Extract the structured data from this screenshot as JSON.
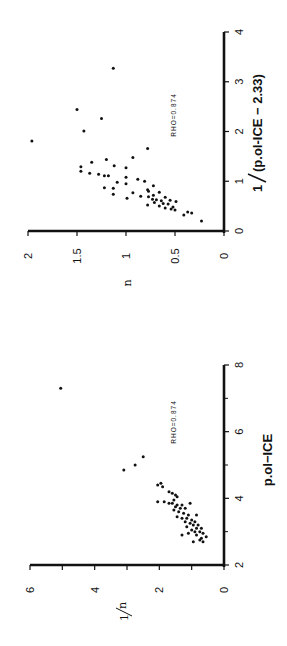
{
  "chart_data": [
    {
      "type": "scatter",
      "title": "",
      "orientation": "rotated 90 degrees counter-clockwise",
      "xlabel": "1/(p.ol-ICE - 2.33)",
      "ylabel": "n",
      "annotation": "RHO=0.874",
      "xlim": [
        0,
        4
      ],
      "ylim": [
        0,
        2
      ],
      "xticks": [
        "0",
        "1",
        "2",
        "3",
        "4"
      ],
      "yticks": [
        "0",
        "0.5",
        "1",
        "1.5",
        "2"
      ],
      "grid": false,
      "points": [
        [
          1.81,
          1.96
        ],
        [
          3.27,
          1.13
        ],
        [
          2.44,
          1.5
        ],
        [
          2.26,
          1.25
        ],
        [
          2.01,
          1.43
        ],
        [
          1.66,
          0.78
        ],
        [
          1.48,
          0.93
        ],
        [
          1.44,
          1.2
        ],
        [
          1.38,
          1.35
        ],
        [
          1.31,
          1.12
        ],
        [
          1.29,
          1.46
        ],
        [
          1.27,
          1.0
        ],
        [
          1.2,
          1.46
        ],
        [
          1.16,
          1.37
        ],
        [
          1.14,
          1.28
        ],
        [
          1.11,
          1.22
        ],
        [
          1.11,
          1.18
        ],
        [
          1.08,
          1.0
        ],
        [
          1.04,
          0.88
        ],
        [
          1.0,
          0.81
        ],
        [
          0.98,
          1.09
        ],
        [
          0.95,
          1.0
        ],
        [
          0.91,
          0.72
        ],
        [
          0.87,
          1.22
        ],
        [
          0.86,
          1.13
        ],
        [
          0.83,
          0.78
        ],
        [
          0.8,
          0.77
        ],
        [
          0.78,
          0.66
        ],
        [
          0.77,
          0.93
        ],
        [
          0.74,
          1.13
        ],
        [
          0.72,
          0.72
        ],
        [
          0.7,
          0.85
        ],
        [
          0.69,
          0.77
        ],
        [
          0.68,
          0.6
        ],
        [
          0.66,
          0.99
        ],
        [
          0.64,
          0.73
        ],
        [
          0.63,
          0.69
        ],
        [
          0.62,
          0.55
        ],
        [
          0.61,
          0.64
        ],
        [
          0.59,
          0.49
        ],
        [
          0.57,
          0.71
        ],
        [
          0.55,
          0.62
        ],
        [
          0.54,
          0.57
        ],
        [
          0.52,
          0.78
        ],
        [
          0.5,
          0.66
        ],
        [
          0.48,
          0.52
        ],
        [
          0.46,
          0.6
        ],
        [
          0.44,
          0.54
        ],
        [
          0.42,
          0.5
        ],
        [
          0.38,
          0.37
        ],
        [
          0.36,
          0.33
        ],
        [
          0.32,
          0.41
        ],
        [
          0.2,
          0.23
        ]
      ]
    },
    {
      "type": "scatter",
      "title": "",
      "orientation": "rotated 90 degrees counter-clockwise",
      "xlabel": "p.ol-ICE",
      "ylabel": "1/n",
      "annotation": "RHO=0.874",
      "xlim": [
        2,
        8
      ],
      "ylim": [
        0,
        6
      ],
      "xticks": [
        "2",
        "4",
        "6",
        "8"
      ],
      "yticks": [
        "0",
        "2",
        "4",
        "6"
      ],
      "grid": false,
      "points": [
        [
          7.3,
          5.05
        ],
        [
          5.25,
          2.5
        ],
        [
          5.0,
          2.75
        ],
        [
          4.85,
          3.1
        ],
        [
          4.45,
          1.95
        ],
        [
          4.4,
          2.05
        ],
        [
          4.35,
          1.9
        ],
        [
          4.2,
          1.7
        ],
        [
          4.15,
          1.6
        ],
        [
          4.1,
          1.5
        ],
        [
          4.05,
          1.45
        ],
        [
          3.95,
          1.55
        ],
        [
          3.9,
          2.05
        ],
        [
          3.9,
          1.85
        ],
        [
          3.85,
          1.7
        ],
        [
          3.85,
          1.6
        ],
        [
          3.8,
          1.45
        ],
        [
          3.8,
          1.3
        ],
        [
          3.85,
          1.05
        ],
        [
          3.75,
          1.5
        ],
        [
          3.7,
          1.35
        ],
        [
          3.7,
          1.2
        ],
        [
          3.65,
          1.55
        ],
        [
          3.6,
          1.4
        ],
        [
          3.55,
          1.25
        ],
        [
          3.5,
          1.1
        ],
        [
          3.5,
          0.85
        ],
        [
          3.45,
          1.45
        ],
        [
          3.4,
          1.3
        ],
        [
          3.4,
          1.15
        ],
        [
          3.35,
          1.0
        ],
        [
          3.3,
          0.9
        ],
        [
          3.3,
          1.2
        ],
        [
          3.25,
          1.05
        ],
        [
          3.2,
          0.95
        ],
        [
          3.2,
          0.8
        ],
        [
          3.15,
          1.15
        ],
        [
          3.1,
          0.85
        ],
        [
          3.1,
          0.7
        ],
        [
          3.05,
          1.0
        ],
        [
          3.0,
          0.9
        ],
        [
          3.0,
          0.75
        ],
        [
          2.95,
          1.1
        ],
        [
          2.95,
          0.65
        ],
        [
          2.9,
          0.85
        ],
        [
          2.9,
          1.3
        ],
        [
          2.85,
          0.55
        ],
        [
          2.8,
          0.7
        ],
        [
          2.75,
          0.75
        ],
        [
          2.7,
          0.95
        ],
        [
          2.7,
          0.65
        ]
      ]
    }
  ],
  "charts": [
    {
      "xlabel_prefix": "1",
      "xlabel_body": "(p.ol-ICE − 2.33)",
      "ylabel": "n",
      "annotation": "RHO=0.874",
      "xticks": [
        "0",
        "1",
        "2",
        "3",
        "4"
      ],
      "yticks": [
        "0",
        "0.5",
        "1",
        "1.5",
        "2"
      ]
    },
    {
      "xlabel": "p.ol−ICE",
      "ylabel_num": "1",
      "ylabel_den": "n",
      "annotation": "RHO=0.874",
      "xticks": [
        "2",
        "4",
        "6",
        "8"
      ],
      "yticks": [
        "0",
        "2",
        "4",
        "6"
      ]
    }
  ]
}
